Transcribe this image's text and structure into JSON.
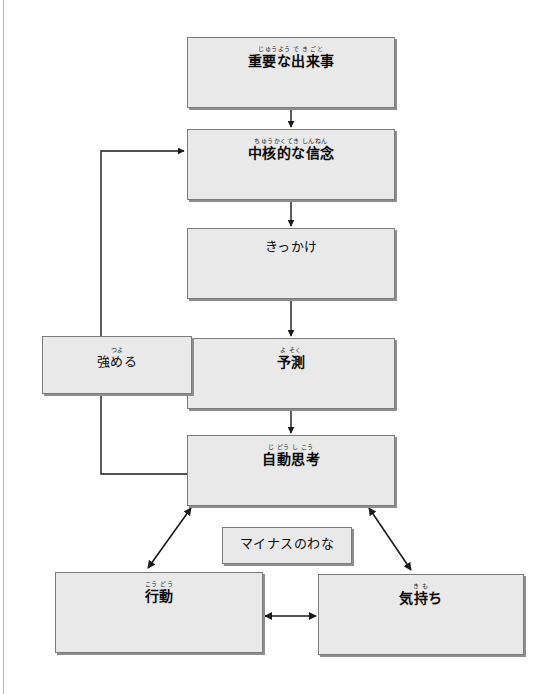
{
  "diagram": {
    "title": "マイナスのわな",
    "style": {
      "node_fill": "#e9e9e9",
      "node_border": "#7b7b7b",
      "node_shadow": "#8e8e8e",
      "line_color": "#1a1a1a",
      "page_rule": "#b9b9b9",
      "background": "#ffffff"
    },
    "nodes": [
      {
        "id": "important-event",
        "ruby": "じゅうよう  で き ごと",
        "base": "重要な出来事",
        "x": 187,
        "y": 37,
        "w": 208,
        "h": 71
      },
      {
        "id": "core-belief",
        "ruby": "ちゅうかくてき    しんねん",
        "base": "中核的な信念",
        "x": 187,
        "y": 129,
        "w": 208,
        "h": 71
      },
      {
        "id": "trigger",
        "ruby": "",
        "base": "きっかけ",
        "x": 187,
        "y": 228,
        "w": 208,
        "h": 71
      },
      {
        "id": "prediction",
        "ruby": "よ そく",
        "base": "予測",
        "x": 187,
        "y": 338,
        "w": 208,
        "h": 71
      },
      {
        "id": "strengthen",
        "ruby": "つよ",
        "base": "強める",
        "x": 42,
        "y": 336,
        "w": 150,
        "h": 58
      },
      {
        "id": "automatic-thought",
        "ruby": "じ どう し こう",
        "base": "自動思考",
        "x": 187,
        "y": 435,
        "w": 208,
        "h": 71
      },
      {
        "id": "negative-trap",
        "ruby": "",
        "base": "マイナスのわな",
        "x": 222,
        "y": 527,
        "w": 130,
        "h": 37
      },
      {
        "id": "behaviour",
        "ruby": "こう どう",
        "base": "行動",
        "x": 55,
        "y": 572,
        "w": 208,
        "h": 81
      },
      {
        "id": "feelings",
        "ruby": "き も",
        "base": "気持ち",
        "x": 318,
        "y": 574,
        "w": 206,
        "h": 81
      }
    ],
    "edges": [
      {
        "id": "event-to-belief",
        "from": "important-event",
        "to": "core-belief",
        "kind": "arrow-down"
      },
      {
        "id": "belief-to-trigger",
        "from": "core-belief",
        "to": "trigger",
        "kind": "arrow-down"
      },
      {
        "id": "trigger-to-prediction",
        "from": "trigger",
        "to": "prediction",
        "kind": "arrow-down"
      },
      {
        "id": "prediction-to-thought",
        "from": "prediction",
        "to": "automatic-thought",
        "kind": "arrow-down"
      },
      {
        "id": "thought-to-belief-loop",
        "from": "automatic-thought",
        "to": "core-belief",
        "kind": "feedback-loop-left"
      },
      {
        "id": "thought-to-behaviour",
        "from": "automatic-thought",
        "to": "behaviour",
        "kind": "arrow-double-diagonal"
      },
      {
        "id": "thought-to-feelings",
        "from": "automatic-thought",
        "to": "feelings",
        "kind": "arrow-double-diagonal"
      },
      {
        "id": "behaviour-to-feelings",
        "from": "behaviour",
        "to": "feelings",
        "kind": "arrow-double-horizontal"
      }
    ]
  }
}
